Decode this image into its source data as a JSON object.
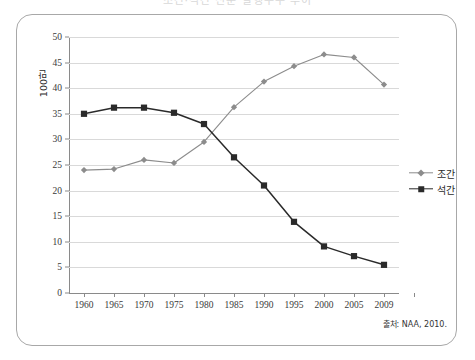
{
  "title": "조간·석간 신문 발행부수 추이",
  "source_note": "출처: NAA, 2010.",
  "legend": {
    "position": "right",
    "entries": [
      {
        "label": "조간",
        "color": "#8c8c8c",
        "marker": "diamond"
      },
      {
        "label": "석간",
        "color": "#2a2a2a",
        "marker": "square"
      }
    ]
  },
  "axis": {
    "y_title": "100만",
    "y_ticks": [
      "0",
      "5",
      "10",
      "15",
      "20",
      "25",
      "30",
      "35",
      "40",
      "45",
      "50"
    ],
    "x_ticks": [
      "1960",
      "1965",
      "1970",
      "1975",
      "1980",
      "1985",
      "1990",
      "1995",
      "2000",
      "2005",
      "2009"
    ]
  },
  "colors": {
    "series_morning": "#8c8c8c",
    "series_evening": "#2a2a2a",
    "gridline": "#d9d9d9",
    "axis": "#8a8a8a",
    "frame": "#a8a8a8"
  },
  "chart_data": {
    "type": "line",
    "title": "조간·석간 신문 발행부수 추이",
    "xlabel": "",
    "ylabel": "100만",
    "ylim": [
      0,
      50
    ],
    "ytick_step": 5,
    "grid": true,
    "legend_position": "right",
    "annotations": [
      "출처: NAA, 2010."
    ],
    "categories": [
      "1960",
      "1965",
      "1970",
      "1975",
      "1980",
      "1985",
      "1990",
      "1995",
      "2000",
      "2005",
      "2009"
    ],
    "series": [
      {
        "name": "조간",
        "marker": "diamond",
        "color": "#8c8c8c",
        "values": [
          24.0,
          24.2,
          26.0,
          25.4,
          29.5,
          36.3,
          41.3,
          44.3,
          46.6,
          46.0,
          40.7
        ]
      },
      {
        "name": "석간",
        "marker": "square",
        "color": "#2a2a2a",
        "values": [
          35.0,
          36.2,
          36.2,
          35.2,
          33.0,
          26.5,
          21.0,
          13.9,
          9.1,
          7.2,
          5.5
        ]
      }
    ]
  }
}
